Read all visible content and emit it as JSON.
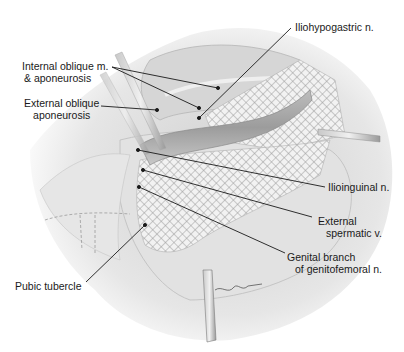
{
  "figure": {
    "type": "surgical illustration",
    "colors": {
      "background": "#ffffff",
      "tissue": "#d9d9d9",
      "mesh": "#f4f4f4",
      "leader_line": "#1a1a1a",
      "label_text": "#1a1a1a"
    }
  },
  "labels": {
    "internal_oblique": {
      "line1": "Internal oblique m.",
      "line2": "& aponeurosis"
    },
    "external_oblique": {
      "line1": "External oblique",
      "line2": "aponeurosis"
    },
    "iliohypogastric": {
      "line1": "Iliohypogastric n."
    },
    "ilioinguinal": {
      "line1": "Ilioinguinal n."
    },
    "external_spermatic": {
      "line1": "External",
      "line2": "spermatic v."
    },
    "genital_branch": {
      "line1": "Genital branch",
      "line2": "of genitofemoral n."
    },
    "pubic_tubercle": {
      "line1": "Pubic tubercle"
    }
  },
  "leaders": [
    {
      "label": "Internal oblique m. & aponeurosis",
      "from": [
        112,
        67
      ],
      "to": [
        [
          218,
          88
        ],
        [
          199,
          108
        ]
      ]
    },
    {
      "label": "External oblique aponeurosis",
      "from": [
        101,
        106
      ],
      "to": [
        [
          157,
          110
        ]
      ]
    },
    {
      "label": "Iliohypogastric n.",
      "from": [
        291,
        28
      ],
      "to": [
        [
          199,
          118
        ]
      ]
    },
    {
      "label": "Ilioinguinal n.",
      "from": [
        325,
        187
      ],
      "to": [
        [
          138,
          150
        ]
      ]
    },
    {
      "label": "External spermatic v.",
      "from": [
        312,
        217
      ],
      "to": [
        [
          143,
          170
        ]
      ]
    },
    {
      "label": "Genital branch of genitofemoral n.",
      "from": [
        285,
        253
      ],
      "to": [
        [
          139,
          187
        ]
      ]
    },
    {
      "label": "Pubic tubercle",
      "from": [
        86,
        282
      ],
      "to": [
        [
          145,
          225
        ]
      ]
    }
  ]
}
